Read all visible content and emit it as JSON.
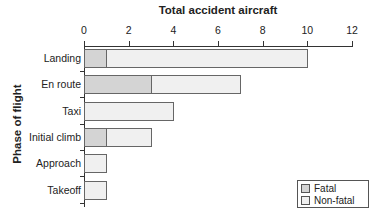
{
  "chart_data": {
    "type": "bar",
    "orientation": "horizontal",
    "stacked": true,
    "title": "Total accident aircraft",
    "xlabel": "Total accident aircraft",
    "ylabel": "Phase of flight",
    "xlim": [
      0,
      12
    ],
    "xticks": [
      0,
      2,
      4,
      6,
      8,
      10,
      12
    ],
    "categories": [
      "Landing",
      "En route",
      "Taxi",
      "Initial climb",
      "Approach",
      "Takeoff"
    ],
    "series": [
      {
        "name": "Fatal",
        "color": "#d4d4d4",
        "values": [
          1,
          3,
          0,
          1,
          0,
          0
        ]
      },
      {
        "name": "Non-fatal",
        "color": "#f0f0f0",
        "values": [
          9,
          4,
          4,
          2,
          1,
          1
        ]
      }
    ],
    "totals": [
      10,
      7,
      4,
      3,
      1,
      1
    ],
    "grid": false,
    "legend_position": "bottom-right"
  },
  "legend": {
    "fatal": "Fatal",
    "nonfatal": "Non-fatal"
  }
}
